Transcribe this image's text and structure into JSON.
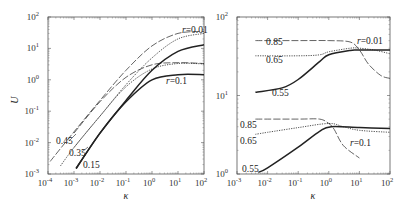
{
  "chart_data": [
    {
      "type": "line",
      "panel": "left",
      "xlabel": "κ",
      "ylabel": "U",
      "xscale": "log",
      "yscale": "log",
      "xlim": [
        0.0001,
        100
      ],
      "ylim": [
        0.001,
        100
      ],
      "xticks": [
        "10-4",
        "10-3",
        "10-2",
        "10-1",
        "100",
        "101",
        "102"
      ],
      "yticks": [
        "10-3",
        "10-2",
        "10-1",
        "100",
        "101",
        "102"
      ],
      "grid": false,
      "annotations": [
        "0.45",
        "0.35",
        "0.15",
        "r=0.01",
        "r=0.1"
      ],
      "series": [
        {
          "name": "0.45, r=0.01",
          "style": "long-dash",
          "x": [
            0.00012,
            0.001,
            0.01,
            0.1,
            1,
            10,
            100
          ],
          "y": [
            0.0025,
            0.022,
            0.22,
            2.0,
            12,
            30,
            35
          ]
        },
        {
          "name": "0.35, r=0.01",
          "style": "dotted",
          "x": [
            0.0003,
            0.001,
            0.01,
            0.1,
            1,
            10,
            100
          ],
          "y": [
            0.0018,
            0.007,
            0.07,
            0.7,
            5,
            20,
            30
          ]
        },
        {
          "name": "0.15, r=0.01",
          "style": "solid",
          "x": [
            0.0012,
            0.01,
            0.1,
            1,
            10,
            100
          ],
          "y": [
            0.0015,
            0.02,
            0.22,
            2.0,
            8,
            13
          ]
        },
        {
          "name": "0.45, r=0.1",
          "style": "long-dash",
          "x": [
            0.001,
            0.01,
            0.1,
            1,
            10,
            100
          ],
          "y": [
            0.02,
            0.2,
            1.2,
            3,
            3.5,
            3.3
          ]
        },
        {
          "name": "0.35, r=0.1",
          "style": "dotted",
          "x": [
            0.001,
            0.01,
            0.1,
            1,
            10,
            100
          ],
          "y": [
            0.007,
            0.07,
            0.6,
            2.2,
            3.3,
            3.2
          ]
        },
        {
          "name": "0.15, r=0.1",
          "style": "solid",
          "x": [
            0.0012,
            0.01,
            0.1,
            1,
            10,
            100
          ],
          "y": [
            0.0015,
            0.02,
            0.2,
            1.0,
            1.45,
            1.45
          ]
        }
      ]
    },
    {
      "type": "line",
      "panel": "right",
      "xlabel": "κ",
      "ylabel": "",
      "xscale": "log",
      "yscale": "log",
      "xlim": [
        0.001,
        100
      ],
      "ylim": [
        1,
        100
      ],
      "xticks": [
        "10-3",
        "10-2",
        "10-1",
        "100",
        "101",
        "102"
      ],
      "yticks": [
        "100",
        "101",
        "102"
      ],
      "grid": false,
      "annotations": [
        "0.85",
        "0.65",
        "0.55",
        "r=0.01",
        "0.85",
        "0.65",
        "0.55",
        "r=0.1"
      ],
      "series": [
        {
          "name": "0.85, r=0.01",
          "style": "long-dash",
          "x": [
            0.004,
            0.1,
            1,
            5,
            10,
            20,
            50,
            100
          ],
          "y": [
            50,
            50,
            50,
            48,
            38,
            25,
            18,
            16.5
          ]
        },
        {
          "name": "0.65, r=0.01",
          "style": "dotted",
          "x": [
            0.004,
            0.1,
            0.5,
            1,
            5,
            10,
            30,
            100
          ],
          "y": [
            32,
            32,
            33,
            36,
            40,
            40,
            38,
            34
          ]
        },
        {
          "name": "0.55, r=0.01",
          "style": "solid",
          "x": [
            0.004,
            0.03,
            0.1,
            0.5,
            1,
            5,
            10,
            100
          ],
          "y": [
            11,
            12.5,
            16,
            27,
            33,
            37.5,
            38,
            38
          ]
        },
        {
          "name": "0.85, r=0.1",
          "style": "long-dash",
          "x": [
            0.004,
            0.1,
            0.5,
            1,
            1.5,
            3,
            10
          ],
          "y": [
            5,
            5,
            5,
            4.4,
            3.7,
            2.3,
            1.6
          ]
        },
        {
          "name": "0.65, r=0.1",
          "style": "dotted",
          "x": [
            0.004,
            0.01,
            0.1,
            1,
            3,
            10,
            100
          ],
          "y": [
            3.2,
            3.4,
            3.9,
            4.4,
            4.0,
            3.6,
            3.4
          ]
        },
        {
          "name": "0.55, r=0.1",
          "style": "solid",
          "x": [
            0.005,
            0.01,
            0.1,
            0.5,
            1.2,
            10,
            100
          ],
          "y": [
            1.05,
            1.2,
            2.2,
            3.5,
            4.0,
            3.9,
            3.8
          ]
        }
      ]
    }
  ],
  "left": {
    "ylabel": "U",
    "xlabel": "κ",
    "labels": {
      "a": "0.45",
      "b": "0.35",
      "c": "0.15",
      "r1": "r=0.01",
      "r2": "r=0.1"
    }
  },
  "right": {
    "xlabel": "κ",
    "labels": {
      "a1": "0.85",
      "b1": "0.65",
      "c1": "0.55",
      "r1": "r=0.01",
      "a2": "0.85",
      "b2": "0.65",
      "c2": "0.55",
      "r2": "r=0.1"
    }
  }
}
